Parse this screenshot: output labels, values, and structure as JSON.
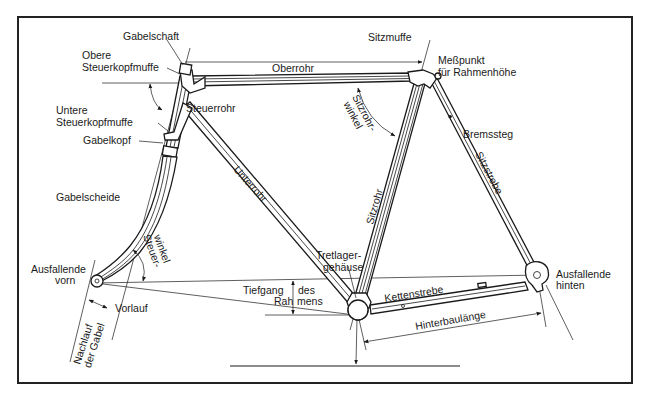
{
  "diagram": {
    "colors": {
      "ink": "#1a1a1a",
      "background": "#ffffff",
      "frame_border": "#222222"
    },
    "labels": {
      "gabelschaft": "Gabelschaft",
      "obere_steuerkopfmuffe_1": "Obere",
      "obere_steuerkopfmuffe_2": "Steuerkopfmuffe",
      "untere_steuerkopfmuffe_1": "Untere",
      "untere_steuerkopfmuffe_2": "Steuerkopfmuffe",
      "gabelkopf": "Gabelkopf",
      "steuerrohr": "Steuerrohr",
      "gabelscheide": "Gabelscheide",
      "steuerwinkel_1": "Steuer-",
      "steuerwinkel_2": "winkel",
      "ausfallende_vorn_1": "Ausfallende",
      "ausfallende_vorn_2": "vorn",
      "vorlauf": "Vorlauf",
      "nachlauf_1": "Nachlauf",
      "nachlauf_2": "der Gabel",
      "oberrohr": "Oberrohr",
      "sitzmuffe": "Sitzmuffe",
      "messpunkt_1": "Meßpunkt",
      "messpunkt_2": "für Rahmenhöhe",
      "sitzrohrwinkel_1": "Sitzrohr-",
      "sitzrohrwinkel_2": "winkel",
      "unterrohr": "Unterrohr",
      "sitzrohr": "Sitzrohr",
      "bremssteg": "Bremssteg",
      "sitzstrebe": "Sitzstrebe",
      "tretlagergehaeuse_1": "Tretlager-",
      "tretlagergehaeuse_2": "gehäuse",
      "tiefgang_1": "Tiefgang",
      "tiefgang_des": "des",
      "tiefgang_2": "Rah",
      "tiefgang_3": "mens",
      "kettenstrebe": "Kettenstrebe",
      "hinterbaulaenge": "Hinterbaulänge",
      "ausfallende_hinten_1": "Ausfallende",
      "ausfallende_hinten_2": "hinten"
    }
  }
}
